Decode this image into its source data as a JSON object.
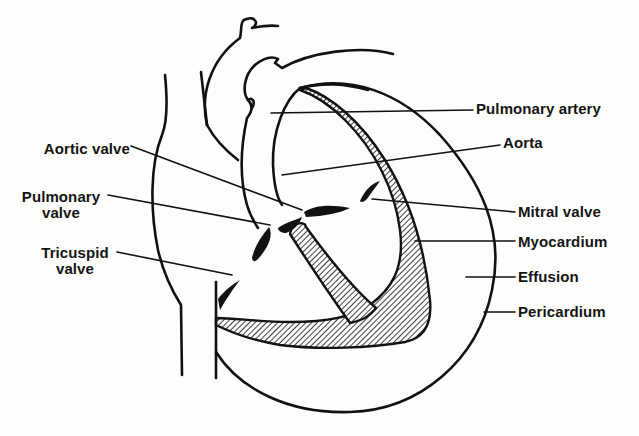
{
  "diagram": {
    "colors": {
      "ink": "#111111",
      "paper": "#fdfdfb",
      "hatch": "#111111"
    },
    "labels": {
      "left": [
        {
          "id": "aortic-valve",
          "text": "Aortic valve"
        },
        {
          "id": "pulmonary-valve",
          "line1": "Pulmonary",
          "line2": "valve"
        },
        {
          "id": "tricuspid-valve",
          "line1": "Tricuspid",
          "line2": "valve"
        }
      ],
      "right": [
        {
          "id": "pulmonary-artery",
          "text": "Pulmonary artery"
        },
        {
          "id": "aorta",
          "text": "Aorta"
        },
        {
          "id": "mitral-valve",
          "text": "Mitral valve"
        },
        {
          "id": "myocardium",
          "text": "Myocardium"
        },
        {
          "id": "effusion",
          "text": "Effusion"
        },
        {
          "id": "pericardium",
          "text": "Pericardium"
        }
      ]
    }
  }
}
